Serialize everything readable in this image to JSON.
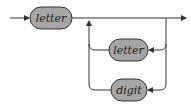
{
  "diagram": {
    "type": "railroad-syntax-diagram",
    "nodes": [
      {
        "id": "letter1",
        "label": "letter"
      },
      {
        "id": "letter2",
        "label": "letter"
      },
      {
        "id": "digit",
        "label": "digit"
      }
    ],
    "colors": {
      "node_fill": "#a6a6a6",
      "stroke": "#333333",
      "background": "#ffffff"
    }
  }
}
